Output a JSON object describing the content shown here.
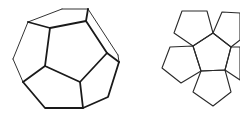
{
  "figure": {
    "stroke_color": "#222222",
    "background": "#ffffff"
  },
  "dodecahedron": {
    "back_edges": [
      "28,22 62,9",
      "62,9 88,9",
      "88,9 118,55",
      "118,55 119,62",
      "28,22 13,59",
      "13,59 23,82"
    ],
    "front_polyline_outer": "23,82 45,108 83,108 108,97 119,62",
    "inner_pentagon": "50,28 86,21 107,53 80,82 45,66",
    "spokes": [
      "50,28 28,22",
      "86,21 88,9",
      "107,53 119,62",
      "80,82 83,108",
      "45,66 23,82"
    ]
  },
  "net": {
    "center": "193,46 213,33 231,47 225,70 201,71",
    "petals": [
      "193,46 213,33 207,11 182,11 174,33",
      "213,33 231,47 240,40 240,13 222,12",
      "231,47 225,70 240,80 240,47",
      "225,70 201,71 193,92 213,106 231,92",
      "201,71 193,46 170,47 162,68 181,83"
    ]
  }
}
